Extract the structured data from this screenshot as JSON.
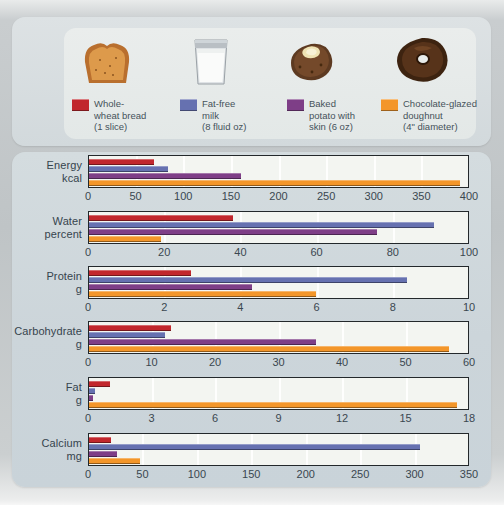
{
  "legend": {
    "items": [
      {
        "color": "#c1272d",
        "icon": "bread-icon",
        "lines": [
          "Whole-",
          "wheat bread",
          "(1 slice)"
        ]
      },
      {
        "color": "#6671b0",
        "icon": "milk-glass-icon",
        "lines": [
          "Fat-free",
          "milk",
          "(8 fluid oz)"
        ]
      },
      {
        "color": "#7e3e87",
        "icon": "baked-potato-icon",
        "lines": [
          "Baked",
          "potato with",
          "skin (6 oz)"
        ]
      },
      {
        "color": "#f3962a",
        "icon": "doughnut-icon",
        "lines": [
          "Chocolate-glazed",
          "doughnut",
          "(4\" diameter)"
        ]
      }
    ]
  },
  "chart_data": {
    "type": "bar",
    "orientation": "horizontal",
    "grid": true,
    "legend_position": "top",
    "series_names": [
      "Whole-wheat bread (1 slice)",
      "Fat-free milk (8 fluid oz)",
      "Baked potato with skin (6 oz)",
      "Chocolate-glazed doughnut (4\" diameter)"
    ],
    "series_colors": [
      "#c1272d",
      "#6671b0",
      "#7e3e87",
      "#f3962a"
    ],
    "panels": [
      {
        "label": "Energy",
        "unit": "kcal",
        "max": 400,
        "ticks": [
          0,
          50,
          100,
          150,
          200,
          250,
          300,
          350,
          400
        ],
        "values": [
          69,
          83,
          160,
          392
        ]
      },
      {
        "label": "Water",
        "unit": "percent",
        "max": 100,
        "ticks": [
          0,
          20,
          40,
          60,
          80,
          100
        ],
        "values": [
          38,
          91,
          76,
          19
        ]
      },
      {
        "label": "Protein",
        "unit": "g",
        "max": 10,
        "ticks": [
          0,
          2,
          4,
          6,
          8,
          10
        ],
        "values": [
          2.7,
          8.4,
          4.3,
          6
        ]
      },
      {
        "label": "Carbohydrate",
        "unit": "g",
        "max": 60,
        "ticks": [
          0,
          10,
          20,
          30,
          40,
          50,
          60
        ],
        "values": [
          13,
          12,
          36,
          57
        ]
      },
      {
        "label": "Fat",
        "unit": "g",
        "max": 18,
        "ticks": [
          0,
          3,
          6,
          9,
          12,
          15,
          18
        ],
        "values": [
          1,
          0.3,
          0.2,
          17.5
        ]
      },
      {
        "label": "Calcium",
        "unit": "mg",
        "max": 350,
        "ticks": [
          0,
          50,
          100,
          150,
          200,
          250,
          300,
          350
        ],
        "values": [
          20,
          306,
          26,
          47
        ]
      }
    ]
  }
}
